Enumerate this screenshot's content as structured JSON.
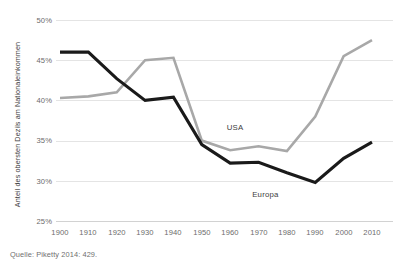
{
  "chart_data": {
    "type": "line",
    "title": "",
    "xlabel": "",
    "ylabel": "Anteil des obersten Dezils am Nationaleinkommen",
    "x": [
      1900,
      1910,
      1920,
      1930,
      1940,
      1950,
      1960,
      1970,
      1980,
      1990,
      2000,
      2010
    ],
    "xlim": [
      1900,
      2010
    ],
    "ylim": [
      25,
      50
    ],
    "ytick_labels": [
      "50%",
      "45%",
      "40%",
      "35%",
      "30%",
      "25%"
    ],
    "ytick_values": [
      50,
      45,
      40,
      35,
      30,
      25
    ],
    "xtick_labels": [
      "1900",
      "1910",
      "1920",
      "1930",
      "1940",
      "1950",
      "1960",
      "1970",
      "1980",
      "1990",
      "2000",
      "2010"
    ],
    "grid": true,
    "legend_position": "inline-annotations",
    "series": [
      {
        "name": "USA",
        "color": "#a8a8a8",
        "label_x": 1963,
        "label_y": 36.6,
        "values": [
          40.3,
          40.5,
          41.0,
          45.0,
          45.3,
          35.0,
          33.8,
          34.3,
          33.7,
          38.0,
          45.5,
          47.5
        ]
      },
      {
        "name": "Europa",
        "color": "#1a1a1a",
        "label_x": 1972,
        "label_y": 28.2,
        "values": [
          46.0,
          46.0,
          42.7,
          40.0,
          40.4,
          34.5,
          32.2,
          32.3,
          31.0,
          29.8,
          32.8,
          34.8
        ]
      }
    ],
    "annotations": [
      {
        "text": "USA"
      },
      {
        "text": "Europa"
      }
    ]
  },
  "source": {
    "note": "Quelle: Piketty 2014: 429."
  }
}
